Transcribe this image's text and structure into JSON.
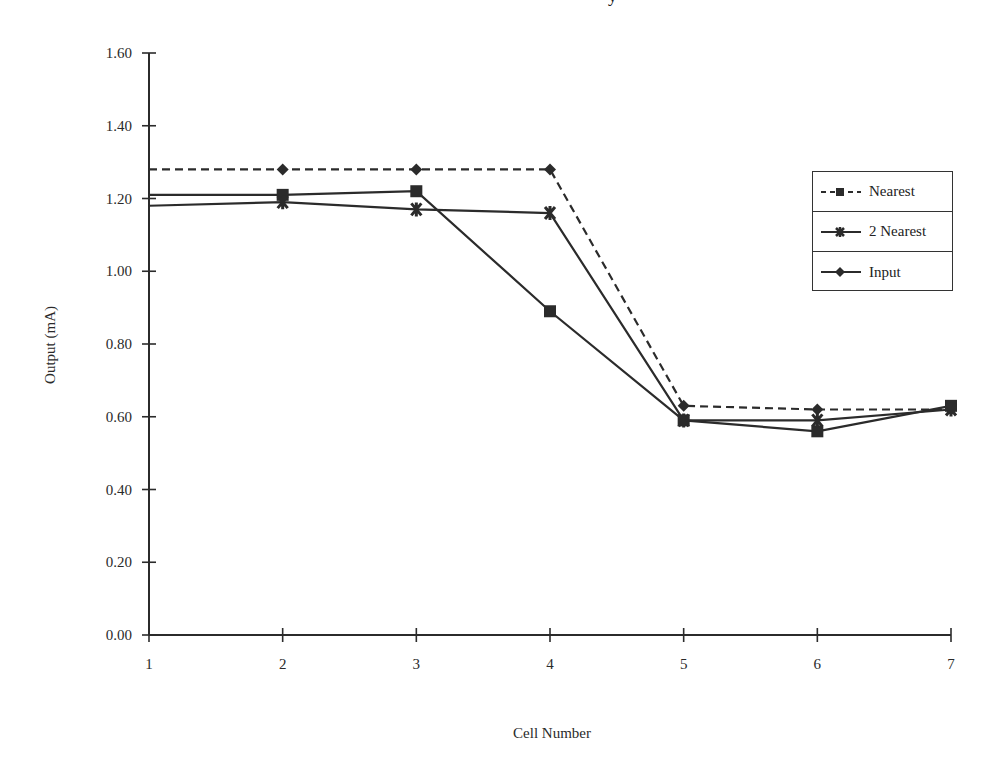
{
  "title_fragment": "y",
  "chart_data": {
    "type": "line",
    "title": "",
    "xlabel": "Cell Number",
    "ylabel": "Output (mA)",
    "x": [
      1,
      2,
      3,
      4,
      5,
      6,
      7
    ],
    "x_ticks": [
      "1",
      "2",
      "3",
      "4",
      "5",
      "6",
      "7"
    ],
    "y_ticks": [
      "0.00",
      "0.20",
      "0.40",
      "0.60",
      "0.80",
      "1.00",
      "1.20",
      "1.40",
      "1.60"
    ],
    "ylim": [
      0,
      1.6
    ],
    "xlim": [
      1,
      7
    ],
    "grid": false,
    "legend_position": "right",
    "series": [
      {
        "name": "Nearest",
        "legend_style": "dashed",
        "legend_marker": "square",
        "plot_style": "dashed",
        "plot_marker": "diamond",
        "values": [
          1.28,
          1.28,
          1.28,
          1.28,
          0.63,
          0.62,
          0.62
        ]
      },
      {
        "name": "2 Nearest",
        "legend_style": "solid",
        "legend_marker": "star",
        "plot_style": "solid",
        "plot_marker": "square",
        "values": [
          1.21,
          1.21,
          1.22,
          0.89,
          0.59,
          0.56,
          0.63
        ]
      },
      {
        "name": "Input",
        "legend_style": "solid",
        "legend_marker": "diamond",
        "plot_style": "solid",
        "plot_marker": "star",
        "values": [
          1.18,
          1.19,
          1.17,
          1.16,
          0.59,
          0.59,
          0.62
        ]
      }
    ]
  },
  "legend": {
    "items": [
      {
        "label": "Nearest"
      },
      {
        "label": "2 Nearest"
      },
      {
        "label": "Input"
      }
    ]
  },
  "colors": {
    "line": "#2b2b2b",
    "background": "#ffffff"
  }
}
